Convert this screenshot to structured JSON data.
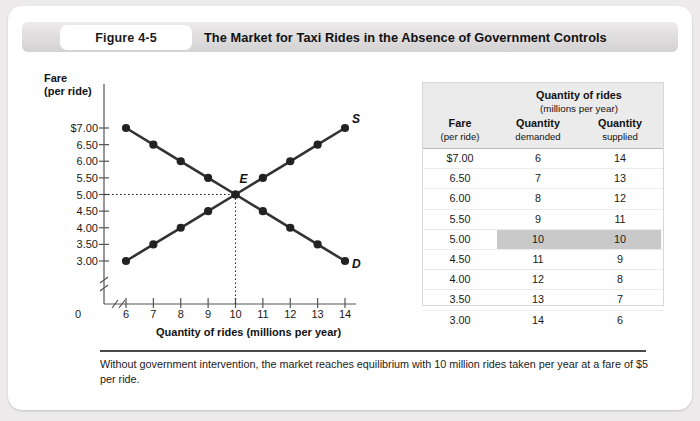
{
  "header": {
    "figure_tab": "Figure 4-5",
    "title": "The Market for Taxi Rides in the Absence of Government Controls"
  },
  "chart_data": {
    "type": "line",
    "title": "The Market for Taxi Rides in the Absence of Government Controls",
    "xlabel": "Quantity of rides (millions per year)",
    "ylabel": "Fare (per ride)",
    "ylabel_line1": "Fare",
    "ylabel_line2": "(per ride)",
    "x": [
      6,
      7,
      8,
      9,
      10,
      11,
      12,
      13,
      14
    ],
    "xlim": [
      6,
      14
    ],
    "ylim": [
      3.0,
      7.0
    ],
    "grid": false,
    "axis_break_x": true,
    "axis_break_y": true,
    "origin_label": "0",
    "xtick_labels": [
      "6",
      "7",
      "8",
      "9",
      "10",
      "11",
      "12",
      "13",
      "14"
    ],
    "ytick_labels": [
      "$7.00",
      "6.50",
      "6.00",
      "5.50",
      "5.00",
      "4.50",
      "4.00",
      "3.50",
      "3.00"
    ],
    "ytick_values": [
      7.0,
      6.5,
      6.0,
      5.5,
      5.0,
      4.5,
      4.0,
      3.5,
      3.0
    ],
    "series": [
      {
        "name": "D",
        "label": "D",
        "description": "Demand curve",
        "values": [
          7.0,
          6.5,
          6.0,
          5.5,
          5.0,
          4.5,
          4.0,
          3.5,
          3.0
        ]
      },
      {
        "name": "S",
        "label": "S",
        "description": "Supply curve",
        "values": [
          3.0,
          3.5,
          4.0,
          4.5,
          5.0,
          5.5,
          6.0,
          6.5,
          7.0
        ]
      }
    ],
    "annotations": [
      {
        "label": "E",
        "description": "Equilibrium point",
        "x": 10,
        "y": 5.0
      }
    ]
  },
  "table": {
    "super_header": "Quantity of rides",
    "super_header_sub": "(millions per year)",
    "columns": [
      {
        "label": "Fare",
        "sub": "(per ride)"
      },
      {
        "label": "Quantity",
        "sub": "demanded"
      },
      {
        "label": "Quantity",
        "sub": "supplied"
      }
    ],
    "rows": [
      {
        "fare": "$7.00",
        "demanded": "6",
        "supplied": "14",
        "equilibrium": false
      },
      {
        "fare": "6.50",
        "demanded": "7",
        "supplied": "13",
        "equilibrium": false
      },
      {
        "fare": "6.00",
        "demanded": "8",
        "supplied": "12",
        "equilibrium": false
      },
      {
        "fare": "5.50",
        "demanded": "9",
        "supplied": "11",
        "equilibrium": false
      },
      {
        "fare": "5.00",
        "demanded": "10",
        "supplied": "10",
        "equilibrium": true
      },
      {
        "fare": "4.50",
        "demanded": "11",
        "supplied": "9",
        "equilibrium": false
      },
      {
        "fare": "4.00",
        "demanded": "12",
        "supplied": "8",
        "equilibrium": false
      },
      {
        "fare": "3.50",
        "demanded": "13",
        "supplied": "7",
        "equilibrium": false
      },
      {
        "fare": "3.00",
        "demanded": "14",
        "supplied": "6",
        "equilibrium": false
      }
    ]
  },
  "caption": "Without government intervention, the market reaches equilibrium with 10 million rides taken per year at a fare of $5 per ride.",
  "colors": {
    "curve": "#333333",
    "panel": "#ffffff",
    "page": "#eceaea",
    "header_bar": "#dedcdc",
    "table_header": "#ebebeb",
    "highlight": "#c9c9c9"
  }
}
